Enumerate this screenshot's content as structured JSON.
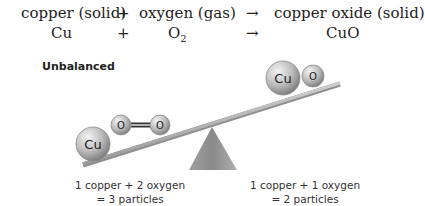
{
  "equation": {
    "words": {
      "reactant1": "copper (solid)",
      "plus": "+",
      "reactant2": "oxygen (gas)",
      "arrow": "→",
      "product": "copper oxide (solid)"
    },
    "formula": {
      "reactant1": "Cu",
      "plus": "+",
      "reactant2_base": "O",
      "reactant2_sub": "2",
      "arrow": "→",
      "product": "CuO"
    }
  },
  "diagram": {
    "status_label": "Unbalanced",
    "left_side": {
      "atoms": [
        "Cu",
        "O",
        "O"
      ],
      "caption_line1": "1 copper + 2 oxygen",
      "caption_line2": "= 3 particles"
    },
    "right_side": {
      "atoms": [
        "Cu",
        "O"
      ],
      "caption_line1": "1 copper + 1 oxygen",
      "caption_line2": "= 2 particles"
    },
    "colors": {
      "atom_fill": "#b8b8b8",
      "beam": "#a9a9a9",
      "fulcrum": "#8c8c8c"
    }
  }
}
